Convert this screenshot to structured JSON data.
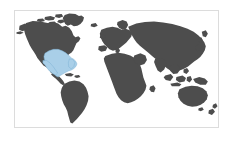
{
  "widget": {
    "name": "world-map-thumbnail",
    "type": "map",
    "projection": "equirectangular",
    "background_color": "#ffffff",
    "frame_color": "#dcdcdc",
    "frame_visible": true
  },
  "map": {
    "title": "",
    "land_color": "#4d4d4d",
    "ocean_color": "#ffffff",
    "highlight_color": "#a9cfe8",
    "highlight_stroke_color": "#7fb3d5",
    "labels_visible": false,
    "graticule_visible": false,
    "legend_visible": false,
    "regions": [
      {
        "name": "north-america",
        "highlighted": false
      },
      {
        "name": "south-america",
        "highlighted": false
      },
      {
        "name": "europe",
        "highlighted": false
      },
      {
        "name": "africa",
        "highlighted": false
      },
      {
        "name": "asia",
        "highlighted": false
      },
      {
        "name": "australia",
        "highlighted": false
      },
      {
        "name": "greenland",
        "highlighted": false
      },
      {
        "name": "gulf-of-mexico-region",
        "highlighted": true
      }
    ],
    "highlighted_region_label": "Gulf of Mexico / Southeastern United States / Mexico / Caribbean"
  }
}
